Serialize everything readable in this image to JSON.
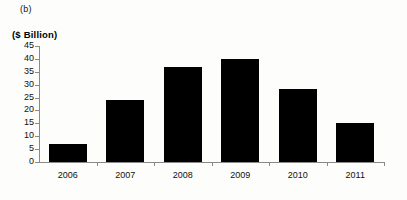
{
  "figure": {
    "panel_label": "(b)",
    "axis_title": "($ Billion)"
  },
  "chart_data": {
    "type": "bar",
    "title": "",
    "subtitle": "",
    "xlabel": "",
    "ylabel": "($ Billion)",
    "categories": [
      "2006",
      "2007",
      "2008",
      "2009",
      "2010",
      "2011"
    ],
    "values": [
      7,
      24,
      37,
      40,
      28.5,
      15
    ],
    "series": [
      {
        "name": "",
        "values": [
          7,
          24,
          37,
          40,
          28.5,
          15
        ]
      }
    ],
    "ylim": [
      0,
      45
    ],
    "ytick_labels": [
      "0",
      "5",
      "10",
      "15",
      "20",
      "25",
      "30",
      "35",
      "40",
      "45"
    ],
    "ytick_values": [
      0,
      5,
      10,
      15,
      20,
      25,
      30,
      35,
      40,
      45
    ],
    "ytick_step": 5,
    "grid": false,
    "legend": null,
    "legend_position": "none",
    "bar_color": "#000000",
    "axis_color": "#8a8a8a",
    "annotations": []
  }
}
